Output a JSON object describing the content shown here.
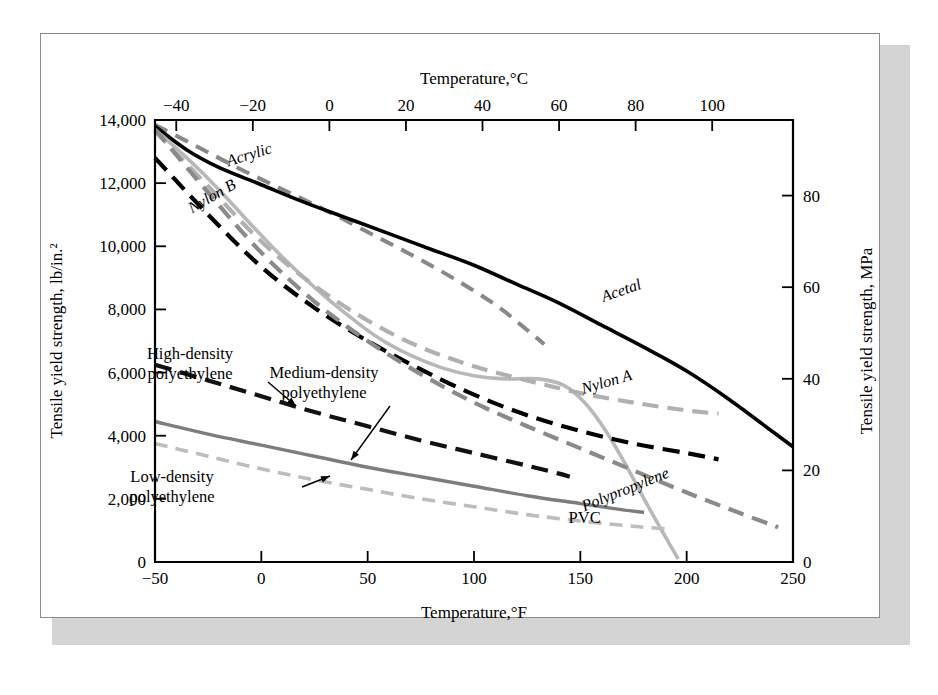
{
  "figure": {
    "background": "#ffffff",
    "frame_color": "#8a8a8a",
    "shadow_color": "#d4d4d4"
  },
  "chart_data": {
    "type": "line",
    "title": "",
    "xlabel": "Temperature,°F",
    "xlabel_top": "Temperature,°C",
    "ylabel": "Tensile yield strength, lb/in.²",
    "ylabel_right": "Tensile yield strength, MPa",
    "xlim": [
      -50,
      250
    ],
    "ylim": [
      0,
      14000
    ],
    "xlim_top_c": [
      -45.6,
      121.1
    ],
    "ylim_right_mpa": [
      0,
      96.5
    ],
    "grid": false,
    "legend": "inline-curve-labels",
    "xticks": [
      -50,
      0,
      50,
      100,
      150,
      200,
      250
    ],
    "xticklabels": [
      "−50",
      "0",
      "50",
      "100",
      "150",
      "200",
      "250"
    ],
    "xticks_top_c": [
      -40,
      -20,
      0,
      20,
      40,
      60,
      80,
      100
    ],
    "xticklabels_top": [
      "−40",
      "−20",
      "0",
      "20",
      "40",
      "60",
      "80",
      "100"
    ],
    "yticks": [
      0,
      2000,
      4000,
      6000,
      8000,
      10000,
      12000,
      14000
    ],
    "yticklabels": [
      "0",
      "2,000",
      "4,000",
      "6,000",
      "8,000",
      "10,000",
      "12,000",
      "14,000"
    ],
    "yticks_right": [
      0,
      20,
      40,
      60,
      80
    ],
    "yticklabels_right": [
      "0",
      "20",
      "40",
      "60",
      "80"
    ],
    "series": [
      {
        "name": "Acrylic",
        "label": "Acrylic",
        "color": "#888888",
        "style": "dashed",
        "width": 4.0,
        "dash": "14,9",
        "label_pos": [
          -5,
          12750
        ],
        "label_rotate": -17,
        "points": [
          [
            -50,
            13850
          ],
          [
            -30,
            13150
          ],
          [
            -10,
            12450
          ],
          [
            10,
            11800
          ],
          [
            30,
            11150
          ],
          [
            50,
            10450
          ],
          [
            70,
            9750
          ],
          [
            90,
            9000
          ],
          [
            110,
            8150
          ],
          [
            125,
            7350
          ],
          [
            133,
            6900
          ]
        ]
      },
      {
        "name": "Acetal",
        "label": "Acetal",
        "color": "#000000",
        "style": "solid",
        "width": 3.6,
        "dash": "",
        "label_pos": [
          170,
          8450
        ],
        "label_rotate": -19,
        "points": [
          [
            -50,
            13800
          ],
          [
            -35,
            13050
          ],
          [
            -20,
            12500
          ],
          [
            0,
            11950
          ],
          [
            20,
            11400
          ],
          [
            40,
            10900
          ],
          [
            60,
            10400
          ],
          [
            80,
            9900
          ],
          [
            100,
            9400
          ],
          [
            120,
            8800
          ],
          [
            140,
            8200
          ],
          [
            160,
            7500
          ],
          [
            180,
            6800
          ],
          [
            200,
            6050
          ],
          [
            220,
            5150
          ],
          [
            240,
            4150
          ],
          [
            250,
            3650
          ]
        ]
      },
      {
        "name": "PVC",
        "label": "PVC",
        "color": "#b8b8b8",
        "style": "solid",
        "width": 3.6,
        "dash": "",
        "label_pos": [
          152,
          1250
        ],
        "label_rotate": 0,
        "points": [
          [
            -50,
            13700
          ],
          [
            -35,
            12800
          ],
          [
            -20,
            11800
          ],
          [
            -5,
            10700
          ],
          [
            10,
            9650
          ],
          [
            25,
            8700
          ],
          [
            40,
            7850
          ],
          [
            55,
            7100
          ],
          [
            70,
            6550
          ],
          [
            85,
            6150
          ],
          [
            100,
            5900
          ],
          [
            115,
            5800
          ],
          [
            130,
            5800
          ],
          [
            142,
            5600
          ],
          [
            152,
            5050
          ],
          [
            162,
            4150
          ],
          [
            172,
            3000
          ],
          [
            182,
            1750
          ],
          [
            190,
            800
          ],
          [
            196,
            100
          ]
        ]
      },
      {
        "name": "Nylon B",
        "label": "Nylon B",
        "color": "#000000",
        "style": "dashed",
        "width": 4.2,
        "dash": "17,9",
        "label_pos": [
          -22,
          11450
        ],
        "label_rotate": -30,
        "points": [
          [
            -50,
            12800
          ],
          [
            -25,
            11000
          ],
          [
            0,
            9350
          ],
          [
            25,
            8050
          ],
          [
            50,
            7000
          ],
          [
            75,
            6100
          ],
          [
            100,
            5300
          ],
          [
            125,
            4650
          ],
          [
            150,
            4150
          ],
          [
            175,
            3750
          ],
          [
            200,
            3450
          ],
          [
            215,
            3250
          ]
        ]
      },
      {
        "name": "Nylon A",
        "label": "Nylon A",
        "color": "#b0b0b0",
        "style": "dashed",
        "width": 4.2,
        "dash": "16,9",
        "label_pos": [
          163,
          5550
        ],
        "label_rotate": -16,
        "points": [
          [
            -50,
            13650
          ],
          [
            -25,
            11900
          ],
          [
            0,
            10150
          ],
          [
            25,
            8750
          ],
          [
            50,
            7650
          ],
          [
            75,
            6800
          ],
          [
            100,
            6200
          ],
          [
            125,
            5750
          ],
          [
            150,
            5350
          ],
          [
            175,
            5050
          ],
          [
            200,
            4800
          ],
          [
            215,
            4700
          ]
        ]
      },
      {
        "name": "Polypropylene",
        "label": "Polypropylene",
        "color": "#8a8a8a",
        "style": "dashed",
        "width": 4.2,
        "dash": "16,9",
        "label_pos": [
          172,
          2150
        ],
        "label_rotate": -22,
        "points": [
          [
            -50,
            13700
          ],
          [
            -25,
            11700
          ],
          [
            0,
            9800
          ],
          [
            25,
            8250
          ],
          [
            50,
            7000
          ],
          [
            75,
            5950
          ],
          [
            100,
            5050
          ],
          [
            125,
            4300
          ],
          [
            150,
            3600
          ],
          [
            175,
            2900
          ],
          [
            200,
            2200
          ],
          [
            225,
            1550
          ],
          [
            243,
            1100
          ]
        ]
      },
      {
        "name": "High-density polyethylene",
        "label": "",
        "color": "#111111",
        "style": "dashed",
        "width": 4.2,
        "dash": "17,9",
        "label_pos": [
          0,
          0
        ],
        "label_rotate": 0,
        "points": [
          [
            -50,
            6250
          ],
          [
            -25,
            5750
          ],
          [
            0,
            5250
          ],
          [
            25,
            4750
          ],
          [
            50,
            4300
          ],
          [
            75,
            3850
          ],
          [
            100,
            3450
          ],
          [
            125,
            3050
          ],
          [
            140,
            2800
          ],
          [
            145,
            2700
          ]
        ]
      },
      {
        "name": "Medium-density polyethylene",
        "label": "",
        "color": "#7d7d7d",
        "style": "solid",
        "width": 3.4,
        "dash": "",
        "label_pos": [
          0,
          0
        ],
        "label_rotate": 0,
        "points": [
          [
            -50,
            4450
          ],
          [
            -25,
            4050
          ],
          [
            0,
            3700
          ],
          [
            25,
            3350
          ],
          [
            50,
            3000
          ],
          [
            75,
            2700
          ],
          [
            100,
            2400
          ],
          [
            125,
            2100
          ],
          [
            150,
            1850
          ],
          [
            170,
            1650
          ],
          [
            180,
            1570
          ]
        ]
      },
      {
        "name": "Low-density polyethylene",
        "label": "",
        "color": "#bdbdbd",
        "style": "dashed",
        "width": 3.6,
        "dash": "13,8",
        "label_pos": [
          0,
          0
        ],
        "label_rotate": 0,
        "points": [
          [
            -50,
            3750
          ],
          [
            -25,
            3350
          ],
          [
            0,
            2950
          ],
          [
            25,
            2600
          ],
          [
            50,
            2300
          ],
          [
            75,
            2000
          ],
          [
            100,
            1750
          ],
          [
            125,
            1500
          ],
          [
            150,
            1300
          ],
          [
            175,
            1130
          ],
          [
            190,
            1050
          ]
        ]
      }
    ],
    "annotations": [
      {
        "name": "high-density-polyethylene",
        "lines": [
          "High-density",
          "polyethylene"
        ],
        "text_x": 190,
        "text_y": 359,
        "leader": "M 268,382 L 296,406"
      },
      {
        "name": "medium-density-polyethylene",
        "lines": [
          "Medium-density",
          "polyethylene"
        ],
        "text_x": 324,
        "text_y": 378,
        "leader": "M 390,406 L 351,460"
      },
      {
        "name": "low-density-polyethylene",
        "lines": [
          "Low-density",
          "polyethylene"
        ],
        "text_x": 172,
        "text_y": 482,
        "leader": "M 302,487 L 330,476"
      }
    ]
  }
}
